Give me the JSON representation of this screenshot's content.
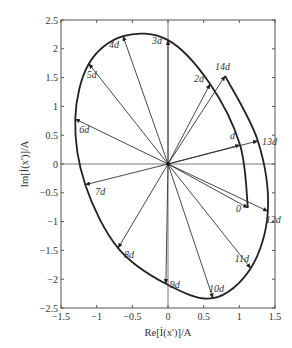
{
  "chart_data": {
    "type": "scatter",
    "subtype": "phasor-locus",
    "title": "",
    "xlabel": "Re[İ(x')]/A",
    "ylabel": "Im[İ(x')]/A",
    "xlim": [
      -1.5,
      1.5
    ],
    "ylim": [
      -2.5,
      2.5
    ],
    "x_ticks": [
      -1.5,
      -1,
      -0.5,
      0,
      0.5,
      1,
      1.5
    ],
    "x_tick_labels": [
      "-1.5",
      "-1",
      "-0.5",
      "0",
      "0.5",
      "1",
      "1.5"
    ],
    "y_ticks": [
      -2.5,
      -2,
      -1.5,
      -1,
      -0.5,
      0,
      0.5,
      1,
      1.5,
      2,
      2.5
    ],
    "y_tick_labels": [
      "-2.5",
      "-2",
      "-1.5",
      "-1",
      "-0.5",
      "0",
      "0.5",
      "1",
      "1.5",
      "2",
      "2.5"
    ],
    "grid": false,
    "origin_axes": true,
    "phasors": [
      {
        "label": "0",
        "x": 1.12,
        "y": -0.76
      },
      {
        "label": "d",
        "x": 1.01,
        "y": 0.33
      },
      {
        "label": "2d",
        "x": 0.59,
        "y": 1.39
      },
      {
        "label": "3d",
        "x": 0.0,
        "y": 2.15
      },
      {
        "label": "4d",
        "x": -0.63,
        "y": 2.22
      },
      {
        "label": "5d",
        "x": -1.11,
        "y": 1.74
      },
      {
        "label": "6d",
        "x": -1.3,
        "y": 0.78
      },
      {
        "label": "7d",
        "x": -1.16,
        "y": -0.36
      },
      {
        "label": "8d",
        "x": -0.7,
        "y": -1.46
      },
      {
        "label": "9d",
        "x": -0.03,
        "y": -2.08
      },
      {
        "label": "10d",
        "x": 0.63,
        "y": -2.33
      },
      {
        "label": "11d",
        "x": 1.16,
        "y": -1.81
      },
      {
        "label": "12d",
        "x": 1.4,
        "y": -0.82
      },
      {
        "label": "13d",
        "x": 1.26,
        "y": 0.4
      },
      {
        "label": "14d",
        "x": 0.8,
        "y": 1.53
      }
    ],
    "locus": "spiral-ellipse traced by phasor tips from 0 through 14d, counter-clockwise",
    "line_color": "#222222"
  }
}
